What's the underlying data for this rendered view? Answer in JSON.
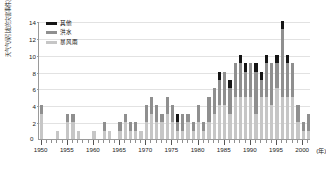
{
  "chart_data": {
    "type": "bar",
    "stacked": true,
    "title": "",
    "xlabel": "年",
    "ylabel": "天气气候引发的灾害事件次数",
    "ylim": [
      0,
      14
    ],
    "yticks": [
      0,
      2,
      4,
      6,
      8,
      10,
      12,
      14
    ],
    "xlim": [
      1949.5,
      2001.5
    ],
    "xticks_major": [
      1950,
      1955,
      1960,
      1965,
      1970,
      1975,
      1980,
      1985,
      1990,
      1995,
      2000
    ],
    "xtick_labels": [
      "1950",
      "1955",
      "1960",
      "1965",
      "1970",
      "1975",
      "1980",
      "1985",
      "1990",
      "1995",
      "2000"
    ],
    "x_unit_label": "(年)",
    "grid": true,
    "legend_position": "top-left",
    "colors": {
      "other": "#151515",
      "flood": "#8f8f8f",
      "storm": "#c6c6c6",
      "grid": "#e2e2e2",
      "axis": "#9a9a9a"
    },
    "categories": [
      1950,
      1951,
      1952,
      1953,
      1954,
      1955,
      1956,
      1957,
      1958,
      1959,
      1960,
      1961,
      1962,
      1963,
      1964,
      1965,
      1966,
      1967,
      1968,
      1969,
      1970,
      1971,
      1972,
      1973,
      1974,
      1975,
      1976,
      1977,
      1978,
      1979,
      1980,
      1981,
      1982,
      1983,
      1984,
      1985,
      1986,
      1987,
      1988,
      1989,
      1990,
      1991,
      1992,
      1993,
      1994,
      1995,
      1996,
      1997,
      1998,
      1999,
      2000,
      2001
    ],
    "series": [
      {
        "name": "暴风雨",
        "key": "storm",
        "color": "#c6c6c6",
        "values": [
          3,
          0,
          0,
          1,
          0,
          2,
          2,
          1,
          0,
          0,
          1,
          0,
          1,
          1,
          0,
          1,
          2,
          1,
          1,
          1,
          2,
          3,
          2,
          2,
          3,
          2,
          1,
          1,
          2,
          1,
          2,
          1,
          2,
          3,
          4,
          4,
          3,
          5,
          5,
          5,
          5,
          3,
          5,
          5,
          4,
          6,
          5,
          5,
          5,
          2,
          1,
          1
        ]
      },
      {
        "name": "洪水",
        "key": "flood",
        "color": "#8f8f8f",
        "values": [
          1,
          0,
          0,
          0,
          0,
          1,
          1,
          0,
          0,
          0,
          0,
          0,
          1,
          0,
          0,
          1,
          1,
          1,
          1,
          0,
          2,
          2,
          2,
          1,
          2,
          2,
          1,
          2,
          1,
          1,
          2,
          1,
          3,
          3,
          3,
          4,
          3,
          4,
          4,
          3,
          4,
          5,
          2,
          4,
          5,
          3,
          8,
          4,
          4,
          2,
          1,
          2
        ]
      },
      {
        "name": "其他",
        "key": "other",
        "color": "#151515",
        "values": [
          0,
          0,
          0,
          0,
          0,
          0,
          0,
          0,
          0,
          0,
          0,
          0,
          0,
          0,
          0,
          0,
          0,
          0,
          0,
          0,
          0,
          0,
          0,
          0,
          0,
          0,
          1,
          0,
          0,
          0,
          0,
          0,
          0,
          0,
          1,
          0,
          1,
          0,
          1,
          1,
          0,
          1,
          1,
          1,
          0,
          1,
          1,
          1,
          0,
          0,
          0,
          0
        ]
      }
    ]
  },
  "legend": {
    "items": [
      {
        "label": "其他",
        "key": "other"
      },
      {
        "label": "洪水",
        "key": "flood"
      },
      {
        "label": "暴风雨",
        "key": "storm"
      }
    ]
  },
  "axes": {
    "zero_label": "0"
  }
}
